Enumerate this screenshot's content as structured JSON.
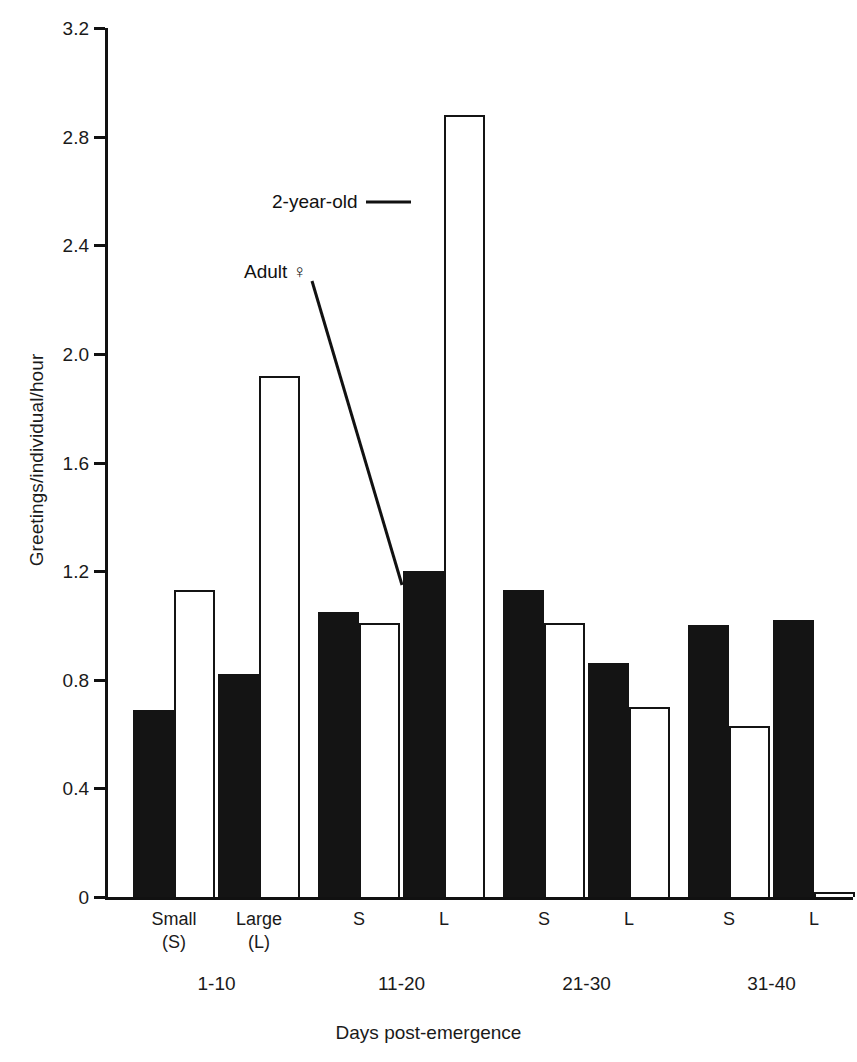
{
  "chart_data": {
    "type": "bar",
    "title": "",
    "xlabel": "Days post-emergence",
    "ylabel": "Greetings/individual/hour",
    "ylim": [
      0,
      3.2
    ],
    "yticks": [
      "0",
      "0.4",
      "0.8",
      "1.2",
      "1.6",
      "2.0",
      "2.4",
      "2.8",
      "3.2"
    ],
    "ytick_values": [
      0,
      0.4,
      0.8,
      1.2,
      1.6,
      2.0,
      2.4,
      2.8,
      3.2
    ],
    "grid": false,
    "legend_position": "inline-annotations",
    "categories": [
      "Small (S)",
      "Large (L)",
      "S",
      "L",
      "S",
      "L",
      "S",
      "L"
    ],
    "group_labels": [
      "1-10",
      "11-20",
      "21-30",
      "31-40"
    ],
    "group_spans": [
      2,
      2,
      2,
      2
    ],
    "series": [
      {
        "name": "Adult ♀",
        "style": "filled",
        "color": "#141414",
        "values": [
          0.69,
          0.82,
          1.05,
          1.2,
          1.13,
          0.86,
          1.0,
          1.02
        ]
      },
      {
        "name": "2-year-old",
        "style": "open",
        "color": "#ffffff",
        "values": [
          1.13,
          1.92,
          1.01,
          2.88,
          1.01,
          0.7,
          0.63,
          0.02
        ]
      }
    ],
    "annotations": [
      {
        "text": "2-year-old",
        "leader": "horizontal"
      },
      {
        "text": "Adult ♀",
        "leader": "diagonal"
      }
    ]
  },
  "axis": {
    "y_label": "Greetings/individual/hour",
    "x_label": "Days post-emergence"
  },
  "ticks": {
    "y": [
      {
        "label": "3.2",
        "value": 3.2
      },
      {
        "label": "2.8",
        "value": 2.8
      },
      {
        "label": "2.4",
        "value": 2.4
      },
      {
        "label": "2.0",
        "value": 2.0
      },
      {
        "label": "1.6",
        "value": 1.6
      },
      {
        "label": "1.2",
        "value": 1.2
      },
      {
        "label": "0.8",
        "value": 0.8
      },
      {
        "label": "0.4",
        "value": 0.4
      },
      {
        "label": "0",
        "value": 0
      }
    ]
  },
  "categories": [
    {
      "label": "Small\n(S)",
      "line1": "Small",
      "line2": "(S)"
    },
    {
      "label": "Large\n(L)",
      "line1": "Large",
      "line2": "(L)"
    },
    {
      "label": "S",
      "line1": "S",
      "line2": ""
    },
    {
      "label": "L",
      "line1": "L",
      "line2": ""
    },
    {
      "label": "S",
      "line1": "S",
      "line2": ""
    },
    {
      "label": "L",
      "line1": "L",
      "line2": ""
    },
    {
      "label": "S",
      "line1": "S",
      "line2": ""
    },
    {
      "label": "L",
      "line1": "L",
      "line2": ""
    }
  ],
  "groups": [
    {
      "label": "1-10"
    },
    {
      "label": "11-20"
    },
    {
      "label": "21-30"
    },
    {
      "label": "31-40"
    }
  ],
  "annotations": {
    "two_year_old": "2-year-old",
    "adult_female": "Adult ♀"
  },
  "colors": {
    "ink": "#141414",
    "paper": "#ffffff"
  }
}
